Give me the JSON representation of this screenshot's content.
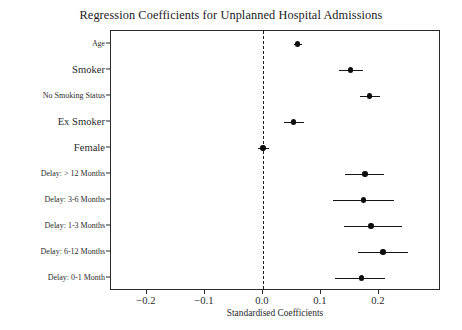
{
  "chart_data": {
    "type": "scatter",
    "title": "Regression Coefficients for Unplanned Hospital Admissions",
    "xlabel": "Standardised Coefficients",
    "ylabel": "",
    "xlim": [
      -0.262,
      0.307
    ],
    "xticks": [
      -0.2,
      -0.1,
      0.0,
      0.1,
      0.2
    ],
    "xticklabels": [
      "−0.2",
      "−0.1",
      "0.0",
      "0.1",
      "0.2"
    ],
    "grid": false,
    "legend": null,
    "reference_line": {
      "x": 0.0,
      "style": "dashed",
      "color": "#1c1c1c"
    },
    "marker_color": "#0d0d0d",
    "errorbar_color": "#141414",
    "categories": [
      "Age",
      "Smoker",
      "No Smoking Status",
      "Ex Smoker",
      "Female",
      "Delay: > 12 Months",
      "Delay: 3-6 Months",
      "Delay: 1-3 Months",
      "Delay: 6-12 Months",
      "Delay: 0-1 Month"
    ],
    "points": [
      {
        "label": "Age",
        "value": 0.06,
        "low": 0.053,
        "high": 0.068
      },
      {
        "label": "Smoker",
        "value": 0.151,
        "low": 0.131,
        "high": 0.172
      },
      {
        "label": "No Smoking Status",
        "value": 0.184,
        "low": 0.167,
        "high": 0.202
      },
      {
        "label": "Ex Smoker",
        "value": 0.053,
        "low": 0.036,
        "high": 0.071
      },
      {
        "label": "Female",
        "value": 0.0,
        "low": -0.009,
        "high": 0.01
      },
      {
        "label": "Delay: > 12 Months",
        "value": 0.176,
        "low": 0.142,
        "high": 0.208
      },
      {
        "label": "Delay: 3-6 Months",
        "value": 0.173,
        "low": 0.121,
        "high": 0.226
      },
      {
        "label": "Delay: 1-3 Months",
        "value": 0.186,
        "low": 0.14,
        "high": 0.239
      },
      {
        "label": "Delay: 6-12 Months",
        "value": 0.207,
        "low": 0.164,
        "high": 0.25
      },
      {
        "label": "Delay: 0-1 Month",
        "value": 0.17,
        "low": 0.124,
        "high": 0.211
      }
    ],
    "label_font_sizes": [
      7.6,
      10.6,
      8.0,
      10.6,
      10.6,
      8.0,
      8.0,
      8.0,
      8.0,
      8.0
    ]
  }
}
